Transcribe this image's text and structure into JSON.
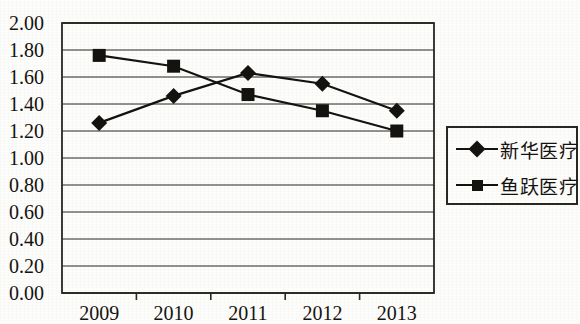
{
  "chart_data": {
    "type": "line",
    "title": "",
    "xlabel": "",
    "ylabel": "",
    "categories": [
      "2009",
      "2010",
      "2011",
      "2012",
      "2013"
    ],
    "ylim": [
      0.0,
      2.0
    ],
    "ytick_step": 0.2,
    "ytick_labels": [
      "0.00",
      "0.20",
      "0.40",
      "0.60",
      "0.80",
      "1.00",
      "1.20",
      "1.40",
      "1.60",
      "1.80",
      "2.00"
    ],
    "grid": true,
    "legend_position": "right",
    "series": [
      {
        "name": "新华医疗",
        "marker": "diamond",
        "color": "#15130f",
        "values": [
          1.26,
          1.46,
          1.63,
          1.55,
          1.35
        ]
      },
      {
        "name": "鱼跃医疗",
        "marker": "square",
        "color": "#15130f",
        "values": [
          1.76,
          1.68,
          1.47,
          1.35,
          1.2
        ]
      }
    ]
  },
  "legend": {
    "entries": [
      {
        "label": "新华医疗",
        "marker": "diamond"
      },
      {
        "label": "鱼跃医疗",
        "marker": "square"
      }
    ]
  },
  "colors": {
    "ink": "#15130f",
    "frame": "#2b2722",
    "background": "#fdfdfb"
  }
}
